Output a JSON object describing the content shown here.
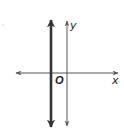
{
  "diagram": {
    "type": "coordinate-plane",
    "axes": {
      "x_label": "x",
      "y_label": "y",
      "origin_label": "O",
      "axis_color": "#555555"
    },
    "bold_line": {
      "description": "vertical line left of y-axis (x = negative constant)",
      "color": "#333333"
    }
  }
}
